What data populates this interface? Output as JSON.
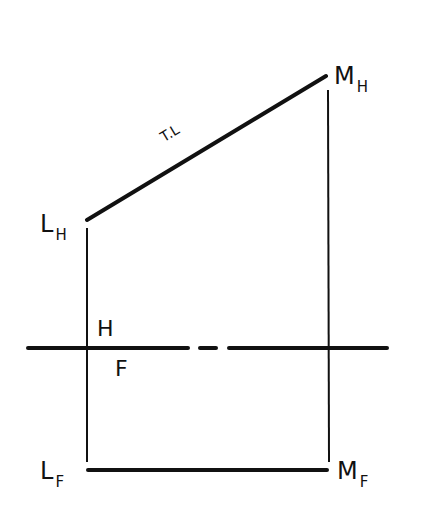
{
  "diagram": {
    "type": "orthographic-projection",
    "labels": {
      "l_h_main": "L",
      "l_h_sub": "H",
      "m_h_main": "M",
      "m_h_sub": "H",
      "l_f_main": "L",
      "l_f_sub": "F",
      "m_f_main": "M",
      "m_f_sub": "F",
      "plane_upper": "H",
      "plane_lower": "F",
      "true_length": "T.L"
    },
    "colors": {
      "line": "#111111",
      "background": "#ffffff"
    }
  }
}
